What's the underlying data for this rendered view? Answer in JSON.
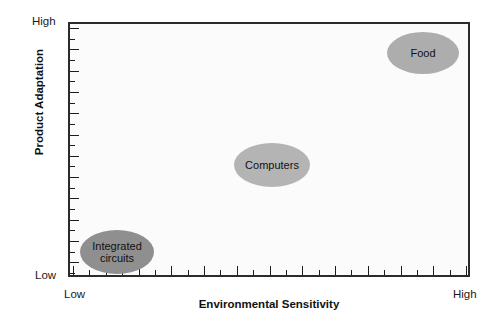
{
  "chart_data": {
    "type": "scatter",
    "title": "",
    "subtitle": "",
    "xlabel": "Environmental Sensitivity",
    "ylabel": "Product Adaptation",
    "x_tick_labels": [
      "Low",
      "High"
    ],
    "y_tick_labels": [
      "Low",
      "High"
    ],
    "xlim": [
      0,
      100
    ],
    "ylim": [
      0,
      100
    ],
    "grid": false,
    "legend": "none",
    "axis_style": "qualitative-scale-with-minor-ticks",
    "x_tick_count": 25,
    "y_tick_count": 24,
    "points": [
      {
        "label": "Integrated circuits",
        "x": 4,
        "y": 10,
        "marker": "ellipse",
        "color": "#8f8f8f",
        "width_px": 74,
        "height_px": 44,
        "left_px": 10,
        "top_px": 206
      },
      {
        "label": "Computers",
        "x": 46,
        "y": 47,
        "marker": "ellipse",
        "color": "#b4b4b4",
        "width_px": 76,
        "height_px": 44,
        "left_px": 164,
        "top_px": 119
      },
      {
        "label": "Food",
        "x": 91,
        "y": 93,
        "marker": "ellipse",
        "color": "#adadad",
        "width_px": 72,
        "height_px": 42,
        "left_px": 317,
        "top_px": 8
      }
    ]
  },
  "axes": {
    "y": {
      "title": "Product Adaptation",
      "high_label": "High",
      "low_label": "Low"
    },
    "x": {
      "title": "Environmental Sensitivity",
      "low_label": "Low",
      "high_label": "High"
    }
  },
  "colors": {
    "frame": "#2b2b2b",
    "plot_background": "#fbfbfb",
    "page_background": "#ffffff",
    "tick": "#1c1c1c",
    "text": "#111111"
  }
}
